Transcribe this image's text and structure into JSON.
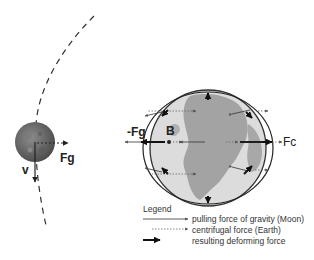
{
  "diagram": {
    "title": "",
    "labels": {
      "moon_gravity": "Fg",
      "moon_velocity": "v",
      "earth_neg_gravity": "-Fg",
      "earth_point": "B",
      "earth_centrifugal": "Fc"
    },
    "legend": {
      "title": "Legend",
      "items": [
        {
          "style": "thin-solid-arrow",
          "label": "pulling force of gravity (Moon)"
        },
        {
          "style": "dotted-arrow",
          "label": "centrifugal force (Earth)"
        },
        {
          "style": "bold-arrow",
          "label": "resulting deforming force"
        }
      ]
    },
    "colors": {
      "ink": "#222222",
      "earth_land": "#9a9a9a",
      "earth_ocean": "#d8d8d8",
      "moon": "#6e6e6e"
    }
  }
}
